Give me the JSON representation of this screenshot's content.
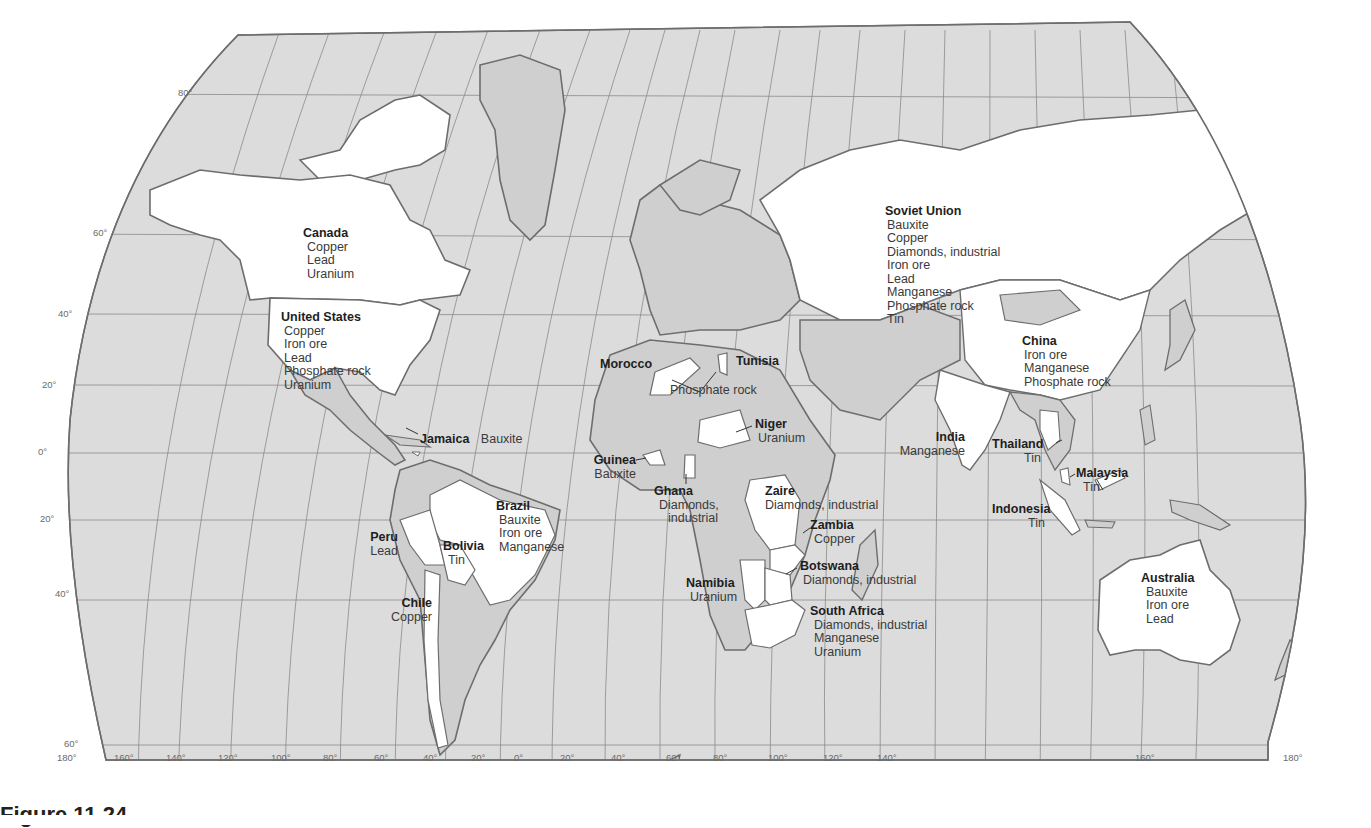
{
  "figure": {
    "caption": "Figure 11.24"
  },
  "map": {
    "projection": "pseudo-cylindrical world map",
    "colors": {
      "ocean": "#dcdcdc",
      "land_other": "#cfcfcf",
      "land_highlight": "#ffffff",
      "outline": "#6d6d6d",
      "graticule": "#8a8a8a"
    },
    "latitude_labels": [
      "80°",
      "60°",
      "40°",
      "20°",
      "0°",
      "20°",
      "40°",
      "60°"
    ],
    "longitude_labels": [
      "180°",
      "160°",
      "140°",
      "120°",
      "100°",
      "80°",
      "60°",
      "40°",
      "20°",
      "0°",
      "20°",
      "40°",
      "60°",
      "80°",
      "100°",
      "120°",
      "140°",
      "160°",
      "180°"
    ]
  },
  "labels": [
    {
      "country": "Canada",
      "minerals": [
        "Copper",
        "Lead",
        "Uranium"
      ]
    },
    {
      "country": "United States",
      "minerals": [
        "Copper",
        "Iron ore",
        "Lead",
        "Phosphate rock",
        "Uranium"
      ]
    },
    {
      "country": "Jamaica",
      "minerals": [
        "Bauxite"
      ]
    },
    {
      "country": "Peru",
      "minerals": [
        "Lead"
      ]
    },
    {
      "country": "Bolivia",
      "minerals": [
        "Tin"
      ]
    },
    {
      "country": "Brazil",
      "minerals": [
        "Bauxite",
        "Iron ore",
        "Manganese"
      ]
    },
    {
      "country": "Chile",
      "minerals": [
        "Copper"
      ]
    },
    {
      "country": "Morocco",
      "minerals": []
    },
    {
      "country": "Tunisia",
      "minerals": []
    },
    {
      "country": "Morocco & Tunisia (shared)",
      "minerals": [
        "Phosphate rock"
      ]
    },
    {
      "country": "Niger",
      "minerals": [
        "Uranium"
      ]
    },
    {
      "country": "Guinea",
      "minerals": [
        "Bauxite"
      ]
    },
    {
      "country": "Ghana",
      "minerals": [
        "Diamonds,",
        "industrial"
      ]
    },
    {
      "country": "Zaire",
      "minerals": [
        "Diamonds, industrial"
      ]
    },
    {
      "country": "Zambia",
      "minerals": [
        "Copper"
      ]
    },
    {
      "country": "Botswana",
      "minerals": [
        "Diamonds, industrial"
      ]
    },
    {
      "country": "Namibia",
      "minerals": [
        "Uranium"
      ]
    },
    {
      "country": "South Africa",
      "minerals": [
        "Diamonds, industrial",
        "Manganese",
        "Uranium"
      ]
    },
    {
      "country": "Soviet Union",
      "minerals": [
        "Bauxite",
        "Copper",
        "Diamonds, industrial",
        "Iron ore",
        "Lead",
        "Manganese",
        "Phosphate rock",
        "Tin"
      ]
    },
    {
      "country": "China",
      "minerals": [
        "Iron ore",
        "Manganese",
        "Phosphate rock"
      ]
    },
    {
      "country": "India",
      "minerals": [
        "Manganese"
      ]
    },
    {
      "country": "Thailand",
      "minerals": [
        "Tin"
      ]
    },
    {
      "country": "Malaysia",
      "minerals": [
        "Tin"
      ]
    },
    {
      "country": "Indonesia",
      "minerals": [
        "Tin"
      ]
    },
    {
      "country": "Australia",
      "minerals": [
        "Bauxite",
        "Iron ore",
        "Lead"
      ]
    }
  ]
}
